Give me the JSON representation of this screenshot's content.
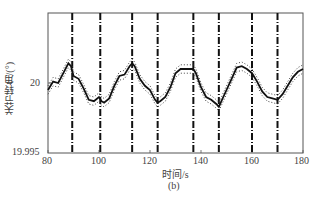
{
  "chart_data": {
    "type": "line",
    "title": "",
    "caption": "(b)",
    "xlabel": "时间/s",
    "ylabel": "关节转角/(°)",
    "xlim": [
      80,
      180
    ],
    "ylim": [
      19.995,
      20.005
    ],
    "xticks": [
      "80",
      "100",
      "120",
      "140",
      "160",
      "180"
    ],
    "yticks": [
      "19.995",
      "20"
    ],
    "grid": false,
    "series": [
      {
        "name": "joint angle",
        "style": "solid",
        "x": [
          80,
          82,
          84,
          86,
          88,
          89,
          90,
          92,
          94,
          96,
          98,
          100,
          101,
          102,
          104,
          106,
          108,
          110,
          112,
          113,
          114,
          116,
          118,
          120,
          122,
          123,
          124,
          126,
          128,
          130,
          132,
          134,
          136,
          137,
          138,
          140,
          142,
          144,
          146,
          147,
          148,
          150,
          152,
          154,
          156,
          158,
          160,
          162,
          164,
          166,
          168,
          170,
          172,
          174,
          176,
          178,
          180
        ],
        "y": [
          19.9995,
          20.0001,
          20.0,
          20.0007,
          20.0014,
          20.0012,
          20.0005,
          20.0003,
          19.9996,
          19.9988,
          19.9987,
          19.999,
          19.9987,
          19.9986,
          19.9989,
          19.9998,
          20.0005,
          20.0006,
          20.0012,
          20.0014,
          20.0012,
          20.0003,
          19.9998,
          19.9995,
          19.9988,
          19.9986,
          19.9987,
          19.999,
          19.9997,
          20.0007,
          20.001,
          20.001,
          20.001,
          20.001,
          20.0007,
          19.9997,
          19.999,
          19.9988,
          19.9985,
          19.9983,
          19.9987,
          19.9995,
          20.0003,
          20.0011,
          20.0012,
          20.001,
          20.0007,
          20.0001,
          19.9994,
          19.999,
          19.9989,
          19.9988,
          19.9992,
          19.9998,
          20.0004,
          20.0008,
          20.001
        ]
      },
      {
        "name": "upper bound",
        "style": "dotted",
        "offset": 0.0003
      },
      {
        "name": "lower bound",
        "style": "dotted",
        "offset": -0.0003
      }
    ],
    "vertical_lines": [
      89.5,
      100.5,
      113,
      123,
      137,
      147,
      160,
      170
    ],
    "vertical_line_style": "dash-dot"
  },
  "labels": {
    "ylabel": "关节转角/(°)",
    "xlabel": "时间/s",
    "caption": "(b)",
    "y20": "20",
    "y19995": "19.995",
    "x80": "80",
    "x100": "100",
    "x120": "120",
    "x140": "140",
    "x160": "160",
    "x180": "180"
  }
}
